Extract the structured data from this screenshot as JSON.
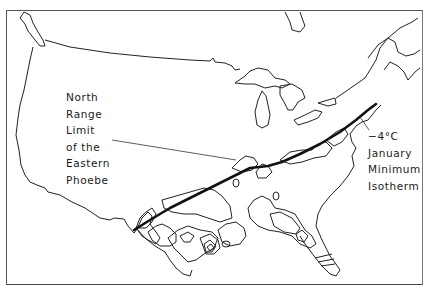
{
  "map": {
    "subject": "Eastern Phoebe winter range and -4°C January minimum isotherm",
    "labels": {
      "range_limit": [
        "North",
        "Range",
        "Limit",
        "of the",
        "Eastern",
        "Phoebe"
      ],
      "isotherm": [
        "−4°C",
        "January",
        "Minimum",
        "Isotherm"
      ]
    },
    "colors": {
      "background": "#ffffff",
      "outline": "#222222",
      "isotherm_line": "#111111",
      "frame": "#555555"
    }
  }
}
